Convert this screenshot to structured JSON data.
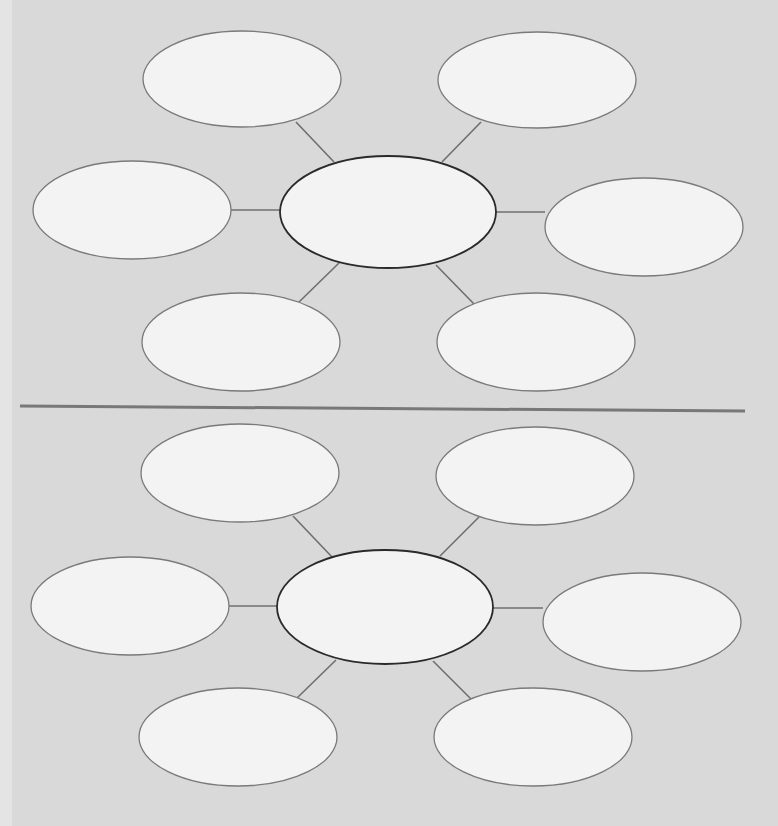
{
  "page": {
    "background": "#d9d9d9",
    "bubble_fill": "#f3f3f3",
    "center_stroke": "#2a2a2a",
    "outer_stroke": "#7a7a7a",
    "connector_stroke": "#6f6f6f",
    "divider_stroke": "#787878"
  },
  "webs": [
    {
      "name": "top-web",
      "center": {
        "cx": 388,
        "cy": 212,
        "rx": 108,
        "ry": 56,
        "label": ""
      },
      "bubbles": [
        {
          "pos": "top-left",
          "cx": 242,
          "cy": 79,
          "rx": 99,
          "ry": 48,
          "label": "",
          "line": [
            296,
            122,
            334,
            162
          ]
        },
        {
          "pos": "top-right",
          "cx": 537,
          "cy": 80,
          "rx": 99,
          "ry": 48,
          "label": "",
          "line": [
            481,
            122,
            442,
            162
          ]
        },
        {
          "pos": "left",
          "cx": 132,
          "cy": 210,
          "rx": 99,
          "ry": 49,
          "label": "",
          "line": [
            231,
            210,
            280,
            210
          ]
        },
        {
          "pos": "right",
          "cx": 644,
          "cy": 227,
          "rx": 99,
          "ry": 49,
          "label": "",
          "line": [
            496,
            212,
            545,
            212
          ]
        },
        {
          "pos": "bottom-left",
          "cx": 241,
          "cy": 342,
          "rx": 99,
          "ry": 49,
          "label": "",
          "line": [
            299,
            302,
            339,
            263
          ]
        },
        {
          "pos": "bottom-right",
          "cx": 536,
          "cy": 342,
          "rx": 99,
          "ry": 49,
          "label": "",
          "line": [
            474,
            304,
            436,
            265
          ]
        }
      ]
    },
    {
      "name": "bottom-web",
      "center": {
        "cx": 385,
        "cy": 607,
        "rx": 108,
        "ry": 57,
        "label": ""
      },
      "bubbles": [
        {
          "pos": "top-left",
          "cx": 240,
          "cy": 473,
          "rx": 99,
          "ry": 49,
          "label": "",
          "line": [
            293,
            516,
            332,
            557
          ]
        },
        {
          "pos": "top-right",
          "cx": 535,
          "cy": 476,
          "rx": 99,
          "ry": 49,
          "label": "",
          "line": [
            479,
            517,
            440,
            556
          ]
        },
        {
          "pos": "left",
          "cx": 130,
          "cy": 606,
          "rx": 99,
          "ry": 49,
          "label": "",
          "line": [
            229,
            606,
            277,
            606
          ]
        },
        {
          "pos": "right",
          "cx": 642,
          "cy": 622,
          "rx": 99,
          "ry": 49,
          "label": "",
          "line": [
            493,
            608,
            543,
            608
          ]
        },
        {
          "pos": "bottom-left",
          "cx": 238,
          "cy": 737,
          "rx": 99,
          "ry": 49,
          "label": "",
          "line": [
            297,
            698,
            336,
            660
          ]
        },
        {
          "pos": "bottom-right",
          "cx": 533,
          "cy": 737,
          "rx": 99,
          "ry": 49,
          "label": "",
          "line": [
            471,
            699,
            433,
            661
          ]
        }
      ]
    }
  ],
  "divider": {
    "x1": 20,
    "y1": 406,
    "x2": 745,
    "y2": 411
  }
}
